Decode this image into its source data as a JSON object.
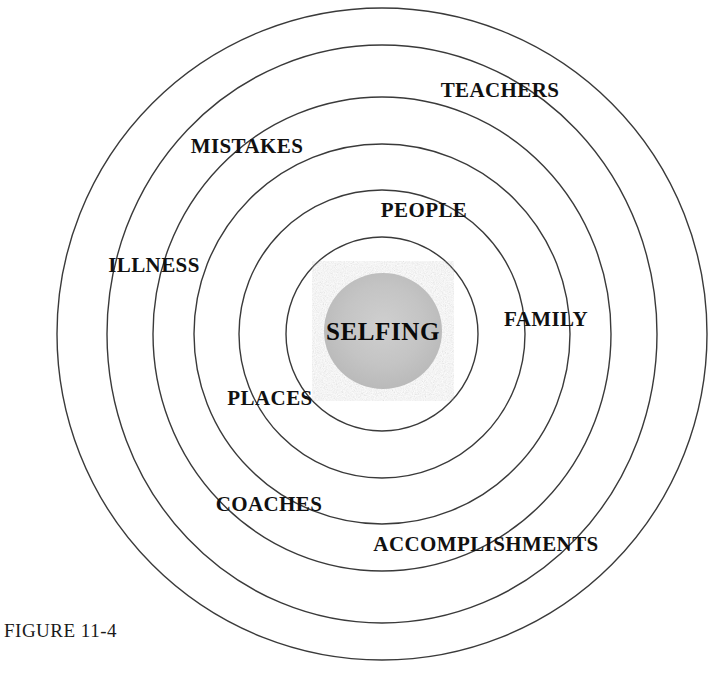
{
  "figure": {
    "caption": "FIGURE 11-4",
    "caption_x": 4,
    "caption_y": 620,
    "caption_size": 19,
    "center_x": 382,
    "center_y": 334,
    "stroke_color": "#3a3a3a",
    "core_fill": "#c2c2c2",
    "background": "#ffffff"
  },
  "core": {
    "label": "SELFING",
    "x": 383,
    "y": 331,
    "rx": 59,
    "ry": 58,
    "font_size": 25
  },
  "rings": [
    {
      "name": "ring-1",
      "rx": 96,
      "ry": 97
    },
    {
      "name": "ring-2",
      "rx": 143,
      "ry": 144
    },
    {
      "name": "ring-3",
      "rx": 188,
      "ry": 190
    },
    {
      "name": "ring-4",
      "rx": 229,
      "ry": 237
    },
    {
      "name": "ring-5",
      "rx": 275,
      "ry": 289
    },
    {
      "name": "ring-6",
      "rx": 325,
      "ry": 326
    }
  ],
  "labels": [
    {
      "text": "TEACHERS",
      "x": 500,
      "y": 90,
      "size": 21,
      "ring": "ring-6"
    },
    {
      "text": "MISTAKES",
      "x": 247,
      "y": 146,
      "size": 21,
      "ring": "ring-5"
    },
    {
      "text": "PEOPLE",
      "x": 424,
      "y": 210,
      "size": 21,
      "ring": "ring-3"
    },
    {
      "text": "ILLNESS",
      "x": 154,
      "y": 265,
      "size": 21,
      "ring": "ring-4"
    },
    {
      "text": "FAMILY",
      "x": 546,
      "y": 319,
      "size": 21,
      "ring": "ring-2"
    },
    {
      "text": "PLACES",
      "x": 270,
      "y": 398,
      "size": 21,
      "ring": "ring-2"
    },
    {
      "text": "COACHES",
      "x": 269,
      "y": 504,
      "size": 21,
      "ring": "ring-3"
    },
    {
      "text": "ACCOMPLISHMENTS",
      "x": 486,
      "y": 544,
      "size": 21,
      "ring": "ring-4"
    }
  ]
}
